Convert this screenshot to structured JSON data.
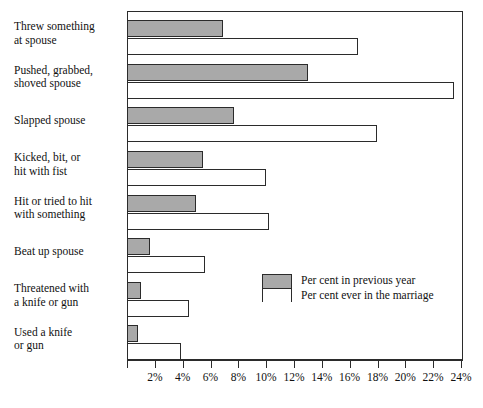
{
  "chart_data": {
    "type": "bar",
    "orientation": "horizontal",
    "title": "",
    "subtitle": "",
    "xlabel": "",
    "ylabel": "",
    "xlim": [
      0,
      24
    ],
    "xtick_step": 2,
    "grid": false,
    "legend_position": "inside-right-middle",
    "categories": [
      "Threw something\nat spouse",
      "Pushed, grabbed,\nshoved spouse",
      "Slapped spouse",
      "Kicked, bit, or\nhit with fist",
      "Hit or tried to hit\nwith something",
      "Beat up spouse",
      "Threatened with\na knife or gun",
      "Used a knife\nor gun"
    ],
    "xtick_labels": [
      "2%",
      "4%",
      "6%",
      "8%",
      "10%",
      "12%",
      "14%",
      "16%",
      "18%",
      "20%",
      "22%",
      "24%"
    ],
    "xtick_values": [
      2,
      4,
      6,
      8,
      10,
      12,
      14,
      16,
      18,
      20,
      22,
      24
    ],
    "series": [
      {
        "name": "Per cent in previous year",
        "key": "prev",
        "color": "#a9a9a9",
        "values": [
          6.8,
          12.9,
          7.6,
          5.4,
          4.9,
          1.6,
          0.9,
          0.7
        ]
      },
      {
        "name": "Per cent ever in the marriage",
        "key": "ever",
        "color": "#ffffff",
        "values": [
          16.5,
          23.4,
          17.9,
          9.9,
          10.1,
          5.5,
          4.4,
          3.8
        ]
      }
    ]
  },
  "legend": {
    "entries": [
      {
        "label": "Per cent in previous year",
        "swatch": "gray"
      },
      {
        "label": "Per cent ever in the marriage",
        "swatch": "white"
      }
    ]
  },
  "colors": {
    "bar_fill_previous_year": "#a9a9a9",
    "bar_fill_ever_marriage": "#ffffff",
    "outline": "#2b2b2b",
    "background": "#ffffff",
    "text": "#111111"
  }
}
